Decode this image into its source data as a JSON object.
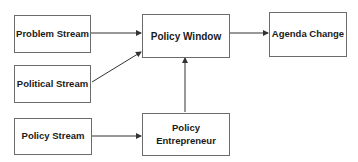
{
  "diagram": {
    "nodes": [
      {
        "id": "problem_stream",
        "label": "Problem Stream"
      },
      {
        "id": "political_stream",
        "label": "Political Stream"
      },
      {
        "id": "policy_stream",
        "label": "Policy Stream"
      },
      {
        "id": "policy_window",
        "label": "Policy Window"
      },
      {
        "id": "agenda_change",
        "label": "Agenda Change"
      },
      {
        "id": "policy_entrepreneur",
        "label": "Policy\nEntrepreneur"
      }
    ],
    "edges": [
      {
        "from": "problem_stream",
        "to": "policy_window"
      },
      {
        "from": "political_stream",
        "to": "policy_window"
      },
      {
        "from": "policy_stream",
        "to": "policy_entrepreneur"
      },
      {
        "from": "policy_entrepreneur",
        "to": "policy_window"
      },
      {
        "from": "policy_window",
        "to": "agenda_change"
      }
    ]
  }
}
